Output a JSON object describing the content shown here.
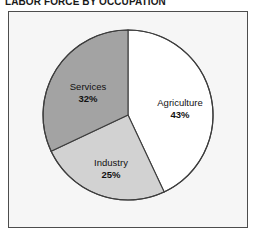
{
  "chart_data": {
    "type": "pie",
    "title": "LABOR FORCE BY OCCUPATION",
    "xlabel": "",
    "ylabel": "",
    "legend": "none",
    "grid": false,
    "start_angle_deg": 0,
    "direction": "clockwise",
    "categories": [
      "Agriculture",
      "Industry",
      "Services"
    ],
    "values": [
      43,
      25,
      32
    ],
    "unit": "%",
    "total": 100,
    "slices": [
      {
        "label": "Agriculture",
        "value": 43,
        "value_text": "43%",
        "color": "#ffffff",
        "start_deg": 0,
        "end_deg": 154.8
      },
      {
        "label": "Industry",
        "value": 25,
        "value_text": "25%",
        "color": "#d2d2d2",
        "start_deg": 154.8,
        "end_deg": 244.8
      },
      {
        "label": "Services",
        "value": 32,
        "value_text": "32%",
        "color": "#a3a3a3",
        "start_deg": 244.8,
        "end_deg": 360
      }
    ]
  },
  "title": {
    "text": "LABOR FORCE BY OCCUPATION"
  },
  "labels": {
    "agriculture": {
      "name": "Agriculture",
      "percent": "43%"
    },
    "industry": {
      "name": "Industry",
      "percent": "25%"
    },
    "services": {
      "name": "Services",
      "percent": "32%"
    }
  },
  "colors": {
    "agriculture": "#ffffff",
    "industry": "#d2d2d2",
    "services": "#a3a3a3",
    "outline": "#3d3d3d",
    "frame_border": "#4d4d4d",
    "plot_background": "#f6f6f6",
    "text": "#111111"
  },
  "geometry": {
    "center_x": 128,
    "center_y": 115,
    "radius": 85
  }
}
